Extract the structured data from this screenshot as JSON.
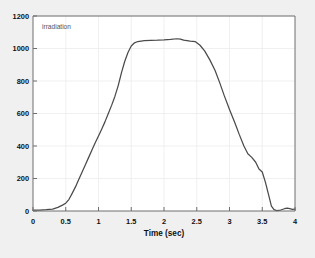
{
  "figure": {
    "background_color": "#f0f0f0",
    "plot_background_color": "#ffffff",
    "axis_color": "#6e6e6e",
    "grid_color": "#e8e8e8",
    "line_color": "#4a4a4a",
    "text_color": "#101010",
    "legend_text_color": "#555555"
  },
  "chart_data": {
    "type": "line",
    "title": "",
    "subtitle": "",
    "xlabel": "Time (sec)",
    "ylabel": "",
    "xlim": [
      0,
      4
    ],
    "ylim": [
      0,
      1200
    ],
    "grid": true,
    "legend_position": "top-left-inside",
    "annotations": [
      "irradiation"
    ],
    "xticks": [
      0,
      0.5,
      1,
      1.5,
      2,
      2.5,
      3,
      3.5,
      4
    ],
    "xticklabels": [
      "0",
      "0.5",
      "1",
      "1.5",
      "2",
      "2.5",
      "3",
      "3.5",
      "4"
    ],
    "yticks": [
      0,
      200,
      400,
      600,
      800,
      1000,
      1200
    ],
    "yticklabels": [
      "0",
      "200",
      "400",
      "600",
      "800",
      "1000",
      "1200"
    ],
    "series": [
      {
        "name": "irradiation",
        "color": "#4a4a4a",
        "x": [
          0.0,
          0.1,
          0.2,
          0.3,
          0.38,
          0.45,
          0.5,
          0.55,
          0.6,
          0.65,
          0.7,
          0.75,
          0.8,
          0.85,
          0.9,
          0.95,
          1.0,
          1.05,
          1.1,
          1.15,
          1.2,
          1.25,
          1.3,
          1.35,
          1.4,
          1.45,
          1.5,
          1.55,
          1.6,
          1.65,
          1.7,
          1.8,
          1.9,
          2.0,
          2.1,
          2.2,
          2.25,
          2.3,
          2.4,
          2.48,
          2.55,
          2.62,
          2.7,
          2.78,
          2.85,
          2.92,
          3.0,
          3.08,
          3.15,
          3.22,
          3.28,
          3.34,
          3.4,
          3.45,
          3.5,
          3.55,
          3.6,
          3.64,
          3.68,
          3.72,
          3.78,
          3.84,
          3.88,
          3.92,
          3.96,
          4.0
        ],
        "y": [
          5,
          6,
          8,
          12,
          22,
          36,
          48,
          72,
          110,
          150,
          195,
          240,
          285,
          330,
          375,
          420,
          462,
          505,
          550,
          600,
          650,
          705,
          770,
          850,
          920,
          975,
          1015,
          1035,
          1043,
          1046,
          1048,
          1050,
          1051,
          1053,
          1056,
          1060,
          1058,
          1052,
          1046,
          1042,
          1020,
          985,
          930,
          865,
          790,
          710,
          625,
          545,
          470,
          400,
          352,
          330,
          300,
          258,
          240,
          175,
          95,
          30,
          8,
          2,
          6,
          14,
          18,
          14,
          10,
          12
        ],
        "notes": "Irradiation pulse: near-zero baseline to 0.45 s, steep rise to plateau ~1050 between 1.5 and 2.5 s, peak ~1060 at 2.2 s, decay with knees near 3.2 s (~350) and 3.45 s (~255), fall to baseline by 3.65 s, small tail ripple to 4 s."
      }
    ]
  },
  "legend": {
    "label": "irradiation"
  }
}
